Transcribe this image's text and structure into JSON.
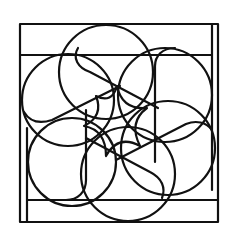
{
  "figure": {
    "stroke_color": "#111111",
    "background_color": "#ffffff",
    "frame": {
      "outer": {
        "x": 20,
        "y": 24,
        "width": 198,
        "height": 198
      },
      "rails": [
        {
          "name": "top-rail",
          "x1": 20,
          "y1": 55,
          "x2": 212,
          "y2": 55
        },
        {
          "name": "right-rail",
          "x1": 212,
          "y1": 24,
          "x2": 212,
          "y2": 190
        },
        {
          "name": "bottom-rail",
          "x1": 27,
          "y1": 200,
          "x2": 218,
          "y2": 200
        },
        {
          "name": "left-rail",
          "x1": 27,
          "y1": 128,
          "x2": 27,
          "y2": 222
        }
      ]
    },
    "center": {
      "x": 117,
      "y": 122
    },
    "petals": [
      {
        "name": "petal-top",
        "cx": 106,
        "cy": 72,
        "r": 47
      },
      {
        "name": "petal-top-right",
        "cx": 165,
        "cy": 95,
        "r": 47
      },
      {
        "name": "petal-bottom-right",
        "cx": 168,
        "cy": 148,
        "r": 47
      },
      {
        "name": "petal-bottom",
        "cx": 128,
        "cy": 174,
        "r": 47
      },
      {
        "name": "petal-bottom-left",
        "cx": 72,
        "cy": 162,
        "r": 44
      },
      {
        "name": "petal-top-left",
        "cx": 68,
        "cy": 100,
        "r": 46
      }
    ]
  }
}
